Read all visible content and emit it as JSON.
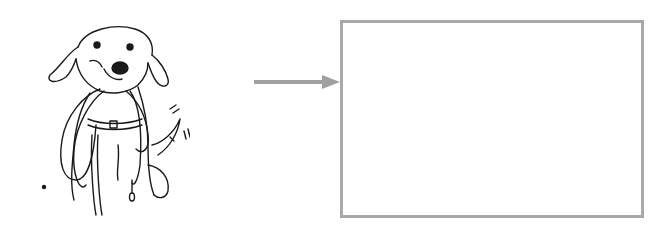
{
  "diagram": {
    "illustration": {
      "subject": "dog holding a leash in its mouth",
      "style": "black line drawing"
    },
    "arrow": {
      "direction": "right",
      "color": "#a0a0a0"
    },
    "answer_box": {
      "content": "",
      "border_color": "#a8a8a8"
    }
  }
}
